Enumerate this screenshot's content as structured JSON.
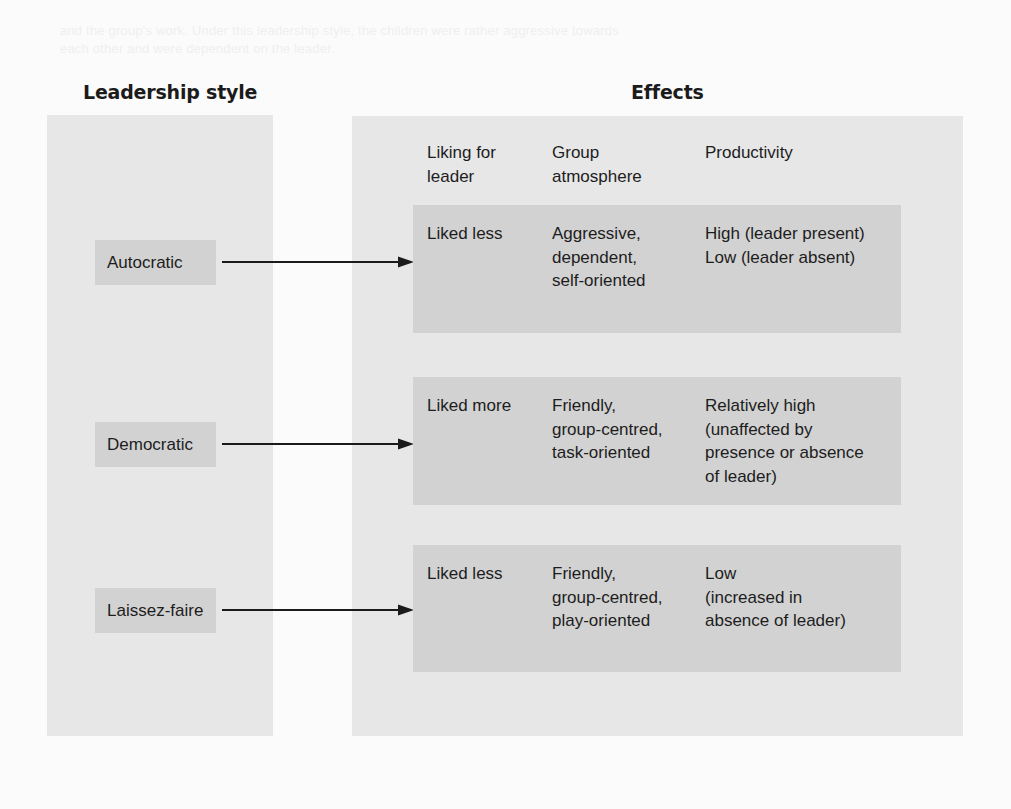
{
  "figure": {
    "bleed_text_line1": "and the group's work. Under this leadership style, the children were rather aggressive towards",
    "bleed_text_line2": "each other and were dependent on the leader.",
    "headings": {
      "left": "Leadership style",
      "right": "Effects"
    },
    "columns": [
      "Liking for\nleader",
      "Group\natmosphere",
      "Productivity"
    ],
    "rows": [
      {
        "style": "Autocratic",
        "liking": "Liked less",
        "atmosphere": "Aggressive,\ndependent,\nself-oriented",
        "productivity": "High (leader present)\nLow (leader absent)"
      },
      {
        "style": "Democratic",
        "liking": "Liked more",
        "atmosphere": "Friendly,\ngroup-centred,\ntask-oriented",
        "productivity": "Relatively high\n(unaffected by\npresence or absence\nof leader)"
      },
      {
        "style": "Laissez-faire",
        "liking": "Liked less",
        "atmosphere": "Friendly,\ngroup-centred,\nplay-oriented",
        "productivity": "Low\n(increased in\nabsence of leader)"
      }
    ],
    "colors": {
      "page_background": "#fbfbfb",
      "panel": "#e7e7e7",
      "box": "#d2d2d2",
      "text": "#1d1d1d",
      "arrow": "#1b1b1b"
    }
  }
}
